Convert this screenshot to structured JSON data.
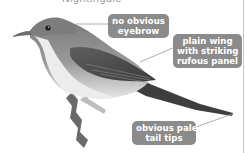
{
  "figure": {
    "title_partial": "Nightingale",
    "colors": {
      "callout_bg": "#8b8b8b",
      "callout_text": "#ffffff",
      "leader_line": "#9a9a9a"
    },
    "callouts": [
      {
        "id": "eyebrow",
        "lines": [
          "no obvious",
          "eyebrow"
        ]
      },
      {
        "id": "wing",
        "lines": [
          "plain wing",
          "with striking",
          "rufous panel"
        ]
      },
      {
        "id": "tail",
        "lines": [
          "obvious pale",
          "tail tips"
        ]
      }
    ]
  }
}
